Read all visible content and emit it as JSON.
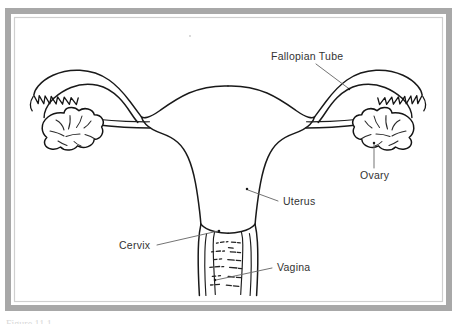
{
  "figure": {
    "background_color": "#ffffff",
    "line_color": "#191919",
    "label_color": "#333333",
    "leader_color": "#6b6b6b",
    "frame": {
      "outer_color": "#a8a8a8",
      "inner_color": "#cfcfcf",
      "style": "grey-double-rule-border"
    },
    "caption_fragment": "Figure 11.1"
  },
  "labels": [
    {
      "id": "fallopian-tube",
      "text": "Fallopian Tube",
      "x": 271,
      "y": 60,
      "anchor": "start",
      "leader": "M 316 64 L 348 88",
      "dot": {
        "x": 349,
        "y": 89
      }
    },
    {
      "id": "ovary",
      "text": "Ovary",
      "x": 360,
      "y": 179,
      "anchor": "start",
      "leader": "M 374 168 L 374 144",
      "dot": {
        "x": 374,
        "y": 143
      }
    },
    {
      "id": "uterus",
      "text": "Uterus",
      "x": 283,
      "y": 205,
      "anchor": "start",
      "leader": "M 278 201 L 248 190",
      "dot": {
        "x": 247,
        "y": 189
      }
    },
    {
      "id": "cervix",
      "text": "Cervix",
      "x": 119,
      "y": 249,
      "anchor": "start",
      "leader": "M 157 245 L 218 231",
      "dot": {
        "x": 219,
        "y": 231
      }
    },
    {
      "id": "vagina",
      "text": "Vagina",
      "x": 277,
      "y": 271,
      "anchor": "start",
      "leader": "M 272 268 L 216 280",
      "dot": {
        "x": 215,
        "y": 280
      }
    }
  ],
  "structures": [
    {
      "id": "uterus-body",
      "name": "Uterus"
    },
    {
      "id": "fallopian-tube-left",
      "name": "Left Fallopian Tube"
    },
    {
      "id": "fallopian-tube-right",
      "name": "Right Fallopian Tube"
    },
    {
      "id": "ovary-left",
      "name": "Left Ovary"
    },
    {
      "id": "ovary-right",
      "name": "Right Ovary"
    },
    {
      "id": "fimbriae-left",
      "name": "Left Fimbriae"
    },
    {
      "id": "fimbriae-right",
      "name": "Right Fimbriae"
    },
    {
      "id": "cervix",
      "name": "Cervix"
    },
    {
      "id": "vaginal-canal",
      "name": "Vagina"
    },
    {
      "id": "vaginal-rugae",
      "name": "Vaginal Rugae"
    }
  ]
}
